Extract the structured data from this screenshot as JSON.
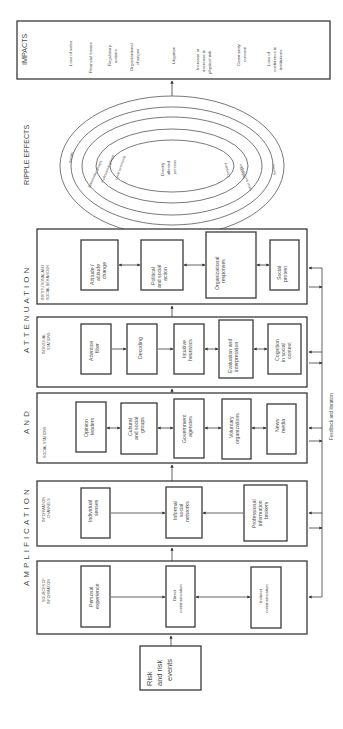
{
  "diagram": {
    "title_sections": {
      "impacts": "IMPACTS",
      "ripple_effects": "RIPPLE EFFECTS",
      "amplification": "AMPLIFICATION",
      "and": "AND",
      "attenuation": "ATTENUATION"
    },
    "impacts": [
      "Loss of sales",
      "Financial losses",
      "Regulatory actions",
      "Organizational changes",
      "Litigation",
      "Increase or decrease in physical risk",
      "Community concern",
      "Loss of confidence in institutions"
    ],
    "ripple": {
      "center": "Directly affected persons",
      "left_rings": [
        "Local community",
        "Professional groups",
        "Stakeholder groups",
        "Society"
      ],
      "right_rings": [
        "Company",
        "Industry",
        "Other technologies",
        "Society"
      ]
    },
    "panels": [
      {
        "label": "INSTITUTIONAL AND SOCIAL BEHAVIOUR",
        "boxes": [
          "Attitude / attitude change",
          "Political and social action",
          "Organizational responses",
          "Social protest"
        ]
      },
      {
        "label": "INDIVIDUAL STATIONS",
        "boxes": [
          "Attention filter",
          "Decoding",
          "Intuitive heuristics",
          "Evaluation and interpretation",
          "Cognition in social context"
        ]
      },
      {
        "label": "SOCIAL STATIONS",
        "boxes": [
          "Opinion leaders",
          "Cultural and social groups",
          "Government agencies",
          "Voluntary organizations",
          "News media"
        ]
      },
      {
        "label": "INFORMATION CHANNELS",
        "boxes": [
          "Individual senses",
          "Informal social networks",
          "Professional information brokers"
        ]
      },
      {
        "label": "SOURCES OF INFORMATION",
        "boxes": [
          "Personal experience",
          "Direct communication",
          "Indirect communication"
        ]
      }
    ],
    "origin": "Risk and risk events",
    "feedback": "Feedback and iteration"
  }
}
